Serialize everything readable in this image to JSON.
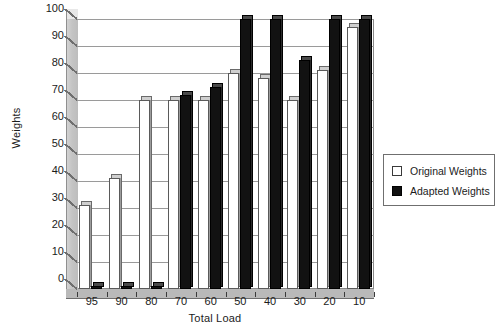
{
  "chart_data": {
    "type": "bar",
    "title": "",
    "xlabel": "Total Load",
    "ylabel": "Weights",
    "categories": [
      "95",
      "90",
      "80",
      "70",
      "60",
      "50",
      "40",
      "30",
      "20",
      "10"
    ],
    "ylim": [
      0,
      100
    ],
    "yticks": [
      0,
      10,
      20,
      30,
      40,
      50,
      60,
      70,
      80,
      90,
      100
    ],
    "grid": true,
    "legend_position": "right",
    "series": [
      {
        "name": "Original Weights",
        "color": "#ffffff",
        "values": [
          31,
          41,
          70,
          70,
          70,
          80,
          78,
          70,
          81,
          97
        ]
      },
      {
        "name": "Adapted Weights",
        "color": "#111111",
        "values": [
          1,
          1,
          1,
          72,
          75,
          100,
          100,
          85,
          100,
          100
        ]
      }
    ]
  },
  "legend": {
    "items": [
      {
        "label": "Original Weights",
        "swatch": "open-square-icon"
      },
      {
        "label": "Adapted Weights",
        "swatch": "filled-square-icon"
      }
    ]
  }
}
